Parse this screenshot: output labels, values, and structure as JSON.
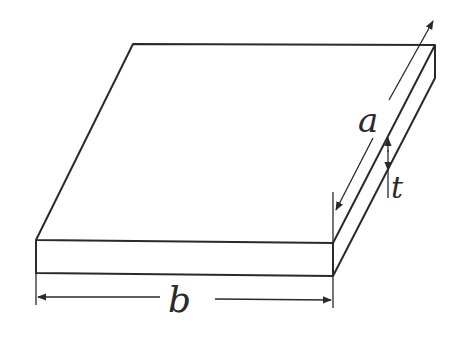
{
  "diagram": {
    "labels": {
      "length_a": "a",
      "width_b": "b",
      "thickness_t": "t"
    },
    "colors": {
      "stroke": "#2a2a2a",
      "background": "#ffffff"
    }
  }
}
